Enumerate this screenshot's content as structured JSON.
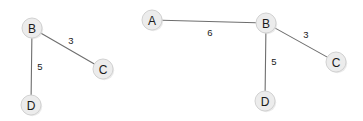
{
  "canvas": {
    "width": 363,
    "height": 121,
    "background": "#ffffff"
  },
  "style": {
    "node_fill": "#ececec",
    "node_stroke": "#d2d2d2",
    "node_shadow": "#d8d8d8",
    "edge_stroke": "#6e6e6e",
    "label_color": "#1a1a1a",
    "node_radius": 10
  },
  "chart_data": {
    "type": "diagram",
    "subtype": "weighted-graph-pair",
    "title": "",
    "graphs": [
      {
        "id": "left-graph",
        "name": "graph-left",
        "nodes": [
          {
            "id": "B",
            "label": "B",
            "x": 32,
            "y": 28
          },
          {
            "id": "C",
            "label": "C",
            "x": 103,
            "y": 69
          },
          {
            "id": "D",
            "label": "D",
            "x": 31,
            "y": 105
          }
        ],
        "edges": [
          {
            "source": "B",
            "target": "C",
            "weight": 3,
            "label": "3",
            "label_x": 71,
            "label_y": 40
          },
          {
            "source": "B",
            "target": "D",
            "weight": 5,
            "label": "5",
            "label_x": 40,
            "label_y": 66
          }
        ]
      },
      {
        "id": "right-graph",
        "name": "graph-right",
        "nodes": [
          {
            "id": "A",
            "label": "A",
            "x": 152,
            "y": 20
          },
          {
            "id": "B",
            "label": "B",
            "x": 266,
            "y": 23
          },
          {
            "id": "C",
            "label": "C",
            "x": 336,
            "y": 62
          },
          {
            "id": "D",
            "label": "D",
            "x": 265,
            "y": 101
          }
        ],
        "edges": [
          {
            "source": "A",
            "target": "B",
            "weight": 6,
            "label": "6",
            "label_x": 210,
            "label_y": 32
          },
          {
            "source": "B",
            "target": "C",
            "weight": 3,
            "label": "3",
            "label_x": 306,
            "label_y": 34
          },
          {
            "source": "B",
            "target": "D",
            "weight": 5,
            "label": "5",
            "label_x": 274,
            "label_y": 61
          }
        ]
      }
    ]
  }
}
